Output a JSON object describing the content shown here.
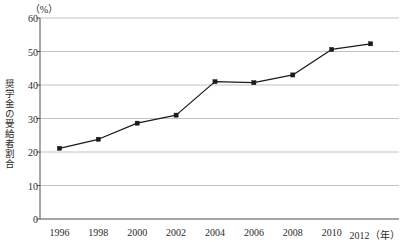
{
  "chart_data": {
    "type": "line",
    "title": "",
    "xlabel": "（年）",
    "ylabel": "奨学金の受給者割合",
    "unit_label": "（%）",
    "categories": [
      "1996",
      "1998",
      "2000",
      "2002",
      "2004",
      "2006",
      "2008",
      "2010",
      "2012"
    ],
    "x": [
      1996,
      1998,
      2000,
      2002,
      2004,
      2006,
      2008,
      2010,
      2012
    ],
    "values": [
      21.1,
      23.8,
      28.6,
      31.0,
      41.0,
      40.7,
      43.0,
      50.6,
      52.3
    ],
    "series": [
      {
        "name": "奨学金の受給者割合",
        "values": [
          21.1,
          23.8,
          28.6,
          31.0,
          41.0,
          40.7,
          43.0,
          50.6,
          52.3
        ]
      }
    ],
    "ylim": [
      0,
      60
    ],
    "yticks": [
      0,
      10,
      20,
      30,
      40,
      50,
      60
    ],
    "ytick_labels": [
      "0",
      "10",
      "20",
      "30",
      "40",
      "50",
      "60"
    ],
    "xlim": [
      1995,
      2013
    ],
    "grid": "horizontal",
    "legend": "none",
    "line_color": "#1a1a1a",
    "marker": "square",
    "marker_color": "#1a1a1a",
    "grid_color": "#b3b3b3",
    "axis_color": "#4d4d4d",
    "background": "#ffffff"
  }
}
